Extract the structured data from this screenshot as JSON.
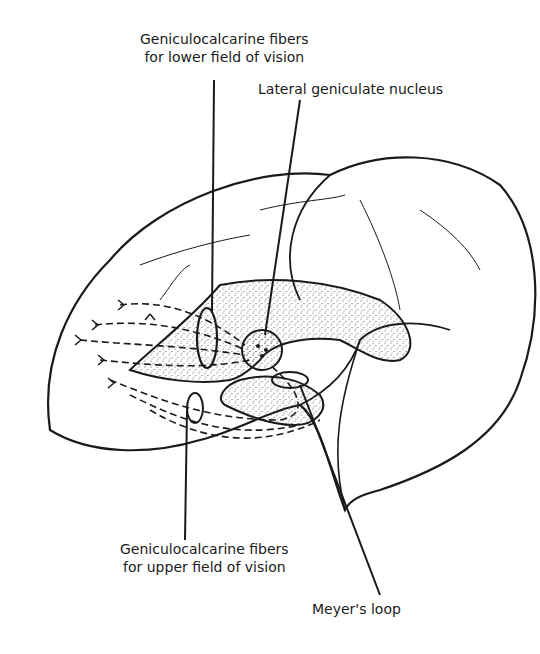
{
  "diagram": {
    "labels": {
      "lower_fibers_line1": "Geniculocalcarine fibers",
      "lower_fibers_line2": "for lower field of vision",
      "lgn": "Lateral geniculate nucleus",
      "upper_fibers_line1": "Geniculocalcarine fibers",
      "upper_fibers_line2": "for upper field of vision",
      "meyer": "Meyer's loop"
    },
    "colors": {
      "ink": "#1a1a1a",
      "background": "#ffffff",
      "stipple": "#555555"
    }
  }
}
